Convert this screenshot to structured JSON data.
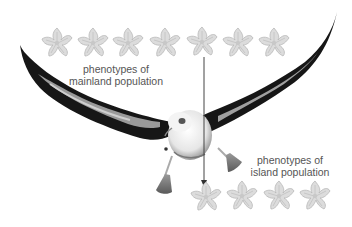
{
  "diagram": {
    "mainland_label": {
      "line1": "phenotypes of",
      "line2": "mainland population"
    },
    "island_label": {
      "line1": "phenotypes of",
      "line2": "island population"
    },
    "mainland_flowers": [
      {
        "x": 57,
        "y": 43
      },
      {
        "x": 93,
        "y": 43
      },
      {
        "x": 128,
        "y": 43
      },
      {
        "x": 165,
        "y": 43
      },
      {
        "x": 202,
        "y": 42
      },
      {
        "x": 238,
        "y": 43
      },
      {
        "x": 274,
        "y": 43
      }
    ],
    "island_flowers": [
      {
        "x": 206,
        "y": 197
      },
      {
        "x": 242,
        "y": 196
      },
      {
        "x": 279,
        "y": 196
      },
      {
        "x": 315,
        "y": 196
      }
    ],
    "arrow": {
      "x": 204,
      "y1": 57,
      "y2": 186
    },
    "colors": {
      "flower_fill": "#d9d9d9",
      "flower_stroke": "#b5b5b5",
      "wing_dark": "#1a1a1a",
      "wing_mid": "#8c8c8c",
      "text": "#555555",
      "arrow": "#444444"
    }
  }
}
